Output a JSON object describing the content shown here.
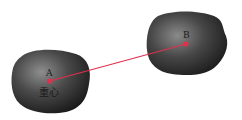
{
  "diagram": {
    "objects": [
      {
        "id": "A",
        "label": "A",
        "sublabel": "重心",
        "center": [
          50,
          81
        ]
      },
      {
        "id": "B",
        "label": "B",
        "sublabel": "",
        "center": [
          186,
          44
        ]
      }
    ],
    "arrow": {
      "from": "A",
      "to": "B",
      "color": "#e0304e"
    },
    "colors": {
      "blob_dark": "#1c1c1c",
      "blob_light": "#8a8a8a",
      "point": "#e0304e",
      "background": "#ffffff"
    }
  }
}
